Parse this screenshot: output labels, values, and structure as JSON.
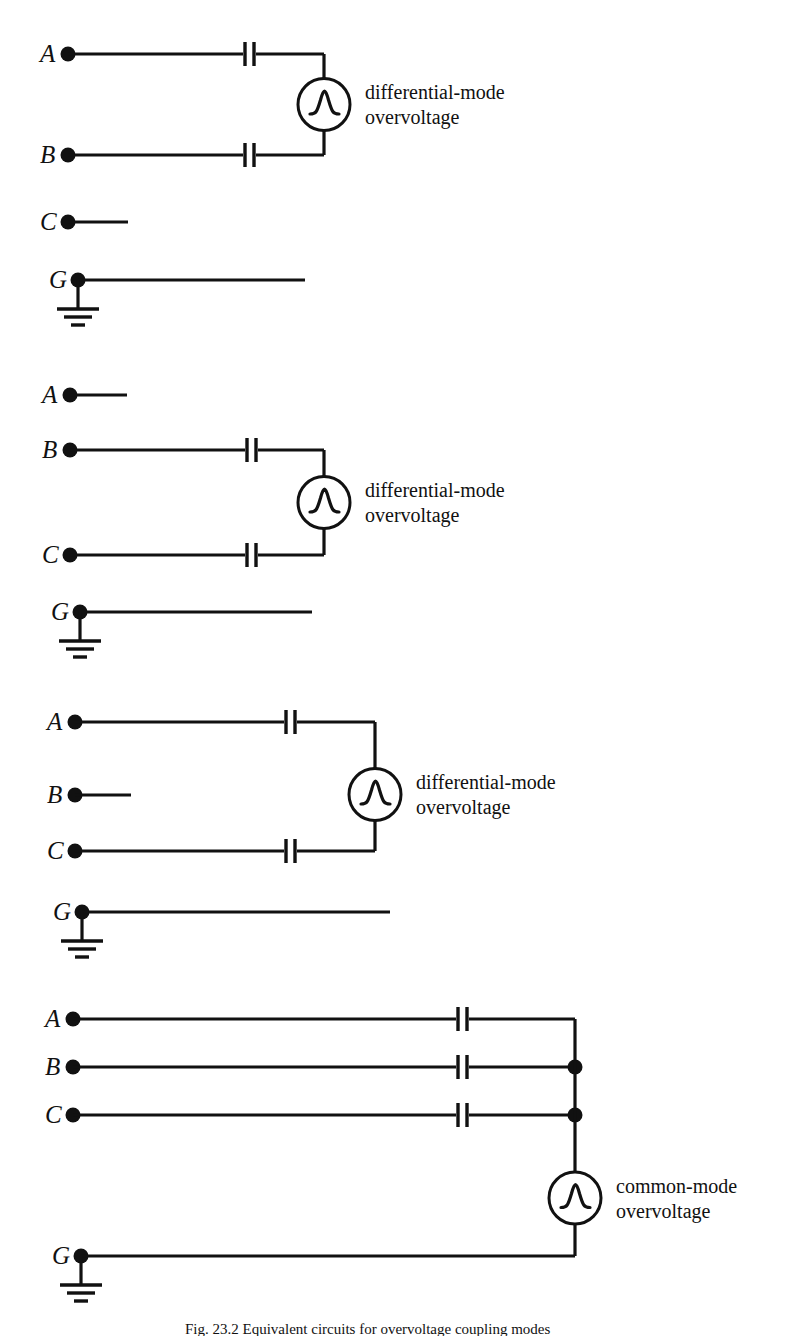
{
  "figure": {
    "background_color": "#ffffff",
    "ink_color": "#111111",
    "caption": "Fig. 23.2  Equivalent circuits for overvoltage coupling modes"
  },
  "blocks": [
    {
      "id": "block-1",
      "mode": "differential-mode",
      "source_label_line1": "differential-mode",
      "source_label_line2": "overvoltage",
      "terminals": [
        {
          "label": "A",
          "role": "phase",
          "connected": true
        },
        {
          "label": "B",
          "role": "phase",
          "connected": true
        },
        {
          "label": "C",
          "role": "phase",
          "connected": false
        },
        {
          "label": "G",
          "role": "ground",
          "connected": false
        }
      ],
      "coupled_pair": "A-B",
      "capacitor_count": 2,
      "has_ground_symbol": true
    },
    {
      "id": "block-2",
      "mode": "differential-mode",
      "source_label_line1": "differential-mode",
      "source_label_line2": "overvoltage",
      "terminals": [
        {
          "label": "A",
          "role": "phase",
          "connected": false
        },
        {
          "label": "B",
          "role": "phase",
          "connected": true
        },
        {
          "label": "C",
          "role": "phase",
          "connected": true
        },
        {
          "label": "G",
          "role": "ground",
          "connected": false
        }
      ],
      "coupled_pair": "B-C",
      "capacitor_count": 2,
      "has_ground_symbol": true
    },
    {
      "id": "block-3",
      "mode": "differential-mode",
      "source_label_line1": "differential-mode",
      "source_label_line2": "overvoltage",
      "terminals": [
        {
          "label": "A",
          "role": "phase",
          "connected": true
        },
        {
          "label": "B",
          "role": "phase",
          "connected": false
        },
        {
          "label": "C",
          "role": "phase",
          "connected": true
        },
        {
          "label": "G",
          "role": "ground",
          "connected": false
        }
      ],
      "coupled_pair": "A-C",
      "capacitor_count": 2,
      "has_ground_symbol": true
    },
    {
      "id": "block-4",
      "mode": "common-mode",
      "source_label_line1": "common-mode",
      "source_label_line2": "overvoltage",
      "terminals": [
        {
          "label": "A",
          "role": "phase",
          "connected": true
        },
        {
          "label": "B",
          "role": "phase",
          "connected": true
        },
        {
          "label": "C",
          "role": "phase",
          "connected": true
        },
        {
          "label": "G",
          "role": "ground",
          "connected": true
        }
      ],
      "coupled_pair": "A-B-C to G",
      "capacitor_count": 3,
      "junction_dot_count": 2,
      "has_ground_symbol": true
    }
  ],
  "symbols": {
    "capacitor": "capacitor-symbol",
    "source": "impulse-source-symbol",
    "ground": "earth-ground-symbol",
    "terminal": "terminal-dot"
  }
}
